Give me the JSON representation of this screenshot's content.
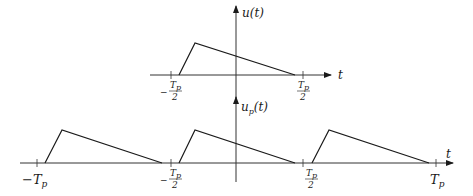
{
  "diagram": {
    "top_plot": {
      "y_axis_label": "u(t)",
      "x_axis_label": "t",
      "tick_labels": {
        "left": {
          "sign": "−",
          "num": "T",
          "num_sub": "p",
          "den": "2"
        },
        "right": {
          "num": "T",
          "num_sub": "p",
          "den": "2"
        }
      }
    },
    "bottom_plot": {
      "y_axis_label": "u",
      "y_axis_label_sub": "p",
      "y_axis_label_arg": "(t)",
      "x_axis_label": "t",
      "tick_labels": {
        "neg_tp": {
          "text": "−T",
          "sub": "p"
        },
        "neg_half": {
          "sign": "−",
          "num": "T",
          "num_sub": "p",
          "den": "2"
        },
        "pos_half": {
          "num": "T",
          "num_sub": "p",
          "den": "2"
        },
        "pos_tp": {
          "text": "T",
          "sub": "p"
        }
      }
    },
    "colors": {
      "line": "#1a1a1a",
      "axis": "#333333"
    }
  }
}
